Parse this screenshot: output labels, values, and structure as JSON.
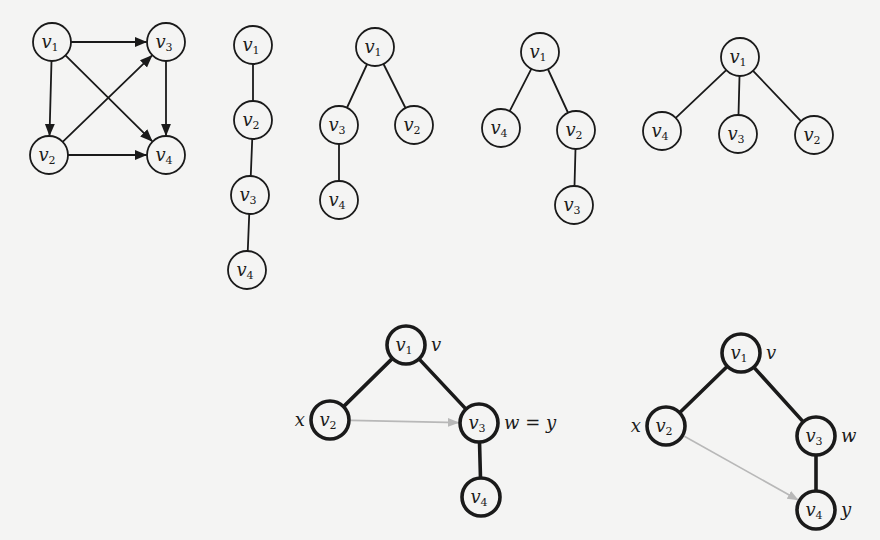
{
  "figure": {
    "background": "#f4f4f3",
    "stroke_color": "#1a1a1a",
    "highlight_edge_color": "#b8b8b8",
    "node_radius": 19
  },
  "graphs": [
    {
      "id": "digraph",
      "kind": "directed",
      "nodes": [
        {
          "id": "v1",
          "base": "v",
          "sub": "1",
          "x": 52,
          "y": 42
        },
        {
          "id": "v3",
          "base": "v",
          "sub": "3",
          "x": 166,
          "y": 42
        },
        {
          "id": "v2",
          "base": "v",
          "sub": "2",
          "x": 49,
          "y": 155
        },
        {
          "id": "v4",
          "base": "v",
          "sub": "4",
          "x": 166,
          "y": 155
        }
      ],
      "edges": [
        {
          "from": "v1",
          "to": "v3"
        },
        {
          "from": "v1",
          "to": "v2"
        },
        {
          "from": "v1",
          "to": "v4"
        },
        {
          "from": "v2",
          "to": "v3"
        },
        {
          "from": "v2",
          "to": "v4"
        },
        {
          "from": "v3",
          "to": "v4"
        }
      ]
    },
    {
      "id": "tree-path",
      "kind": "tree",
      "nodes": [
        {
          "id": "v1",
          "base": "v",
          "sub": "1",
          "x": 253,
          "y": 45
        },
        {
          "id": "v2",
          "base": "v",
          "sub": "2",
          "x": 253,
          "y": 120
        },
        {
          "id": "v3",
          "base": "v",
          "sub": "3",
          "x": 250,
          "y": 195
        },
        {
          "id": "v4",
          "base": "v",
          "sub": "4",
          "x": 247,
          "y": 270
        }
      ],
      "edges": [
        {
          "from": "v1",
          "to": "v2"
        },
        {
          "from": "v2",
          "to": "v3"
        },
        {
          "from": "v3",
          "to": "v4"
        }
      ]
    },
    {
      "id": "tree-2",
      "kind": "tree",
      "nodes": [
        {
          "id": "v1",
          "base": "v",
          "sub": "1",
          "x": 375,
          "y": 47
        },
        {
          "id": "v3",
          "base": "v",
          "sub": "3",
          "x": 339,
          "y": 125
        },
        {
          "id": "v2",
          "base": "v",
          "sub": "2",
          "x": 414,
          "y": 125
        },
        {
          "id": "v4",
          "base": "v",
          "sub": "4",
          "x": 339,
          "y": 200
        }
      ],
      "edges": [
        {
          "from": "v1",
          "to": "v3"
        },
        {
          "from": "v1",
          "to": "v2"
        },
        {
          "from": "v3",
          "to": "v4"
        }
      ]
    },
    {
      "id": "tree-3",
      "kind": "tree",
      "nodes": [
        {
          "id": "v1",
          "base": "v",
          "sub": "1",
          "x": 540,
          "y": 52
        },
        {
          "id": "v4",
          "base": "v",
          "sub": "4",
          "x": 501,
          "y": 128
        },
        {
          "id": "v2",
          "base": "v",
          "sub": "2",
          "x": 576,
          "y": 130
        },
        {
          "id": "v3",
          "base": "v",
          "sub": "3",
          "x": 574,
          "y": 205
        }
      ],
      "edges": [
        {
          "from": "v1",
          "to": "v4"
        },
        {
          "from": "v1",
          "to": "v2"
        },
        {
          "from": "v2",
          "to": "v3"
        }
      ]
    },
    {
      "id": "tree-4",
      "kind": "tree",
      "nodes": [
        {
          "id": "v1",
          "base": "v",
          "sub": "1",
          "x": 740,
          "y": 57
        },
        {
          "id": "v4",
          "base": "v",
          "sub": "4",
          "x": 662,
          "y": 131
        },
        {
          "id": "v3",
          "base": "v",
          "sub": "3",
          "x": 738,
          "y": 134
        },
        {
          "id": "v2",
          "base": "v",
          "sub": "2",
          "x": 814,
          "y": 135
        }
      ],
      "edges": [
        {
          "from": "v1",
          "to": "v4"
        },
        {
          "from": "v1",
          "to": "v3"
        },
        {
          "from": "v1",
          "to": "v2"
        }
      ]
    },
    {
      "id": "ancestor-case-1",
      "kind": "tree-bold",
      "nodes": [
        {
          "id": "v1",
          "base": "v",
          "sub": "1",
          "x": 406,
          "y": 345,
          "side_label": "v",
          "side": "right"
        },
        {
          "id": "v2",
          "base": "v",
          "sub": "2",
          "x": 330,
          "y": 420,
          "side_label": "x",
          "side": "left"
        },
        {
          "id": "v3",
          "base": "v",
          "sub": "3",
          "x": 479,
          "y": 423,
          "side_label": "w = y",
          "side": "right"
        },
        {
          "id": "v4",
          "base": "v",
          "sub": "4",
          "x": 481,
          "y": 497
        }
      ],
      "edges": [
        {
          "from": "v1",
          "to": "v2"
        },
        {
          "from": "v1",
          "to": "v3"
        },
        {
          "from": "v3",
          "to": "v4"
        }
      ],
      "highlight_arrows": [
        {
          "from": "v2",
          "to": "v3"
        }
      ]
    },
    {
      "id": "ancestor-case-2",
      "kind": "tree-bold",
      "nodes": [
        {
          "id": "v1",
          "base": "v",
          "sub": "1",
          "x": 741,
          "y": 353,
          "side_label": "v",
          "side": "right"
        },
        {
          "id": "v2",
          "base": "v",
          "sub": "2",
          "x": 666,
          "y": 426,
          "side_label": "x",
          "side": "left"
        },
        {
          "id": "v3",
          "base": "v",
          "sub": "3",
          "x": 816,
          "y": 436,
          "side_label": "w",
          "side": "right"
        },
        {
          "id": "v4",
          "base": "v",
          "sub": "4",
          "x": 816,
          "y": 510,
          "side_label": "y",
          "side": "right"
        }
      ],
      "edges": [
        {
          "from": "v1",
          "to": "v2"
        },
        {
          "from": "v1",
          "to": "v3"
        },
        {
          "from": "v3",
          "to": "v4"
        }
      ],
      "highlight_arrows": [
        {
          "from": "v2",
          "to": "v4"
        }
      ]
    }
  ]
}
